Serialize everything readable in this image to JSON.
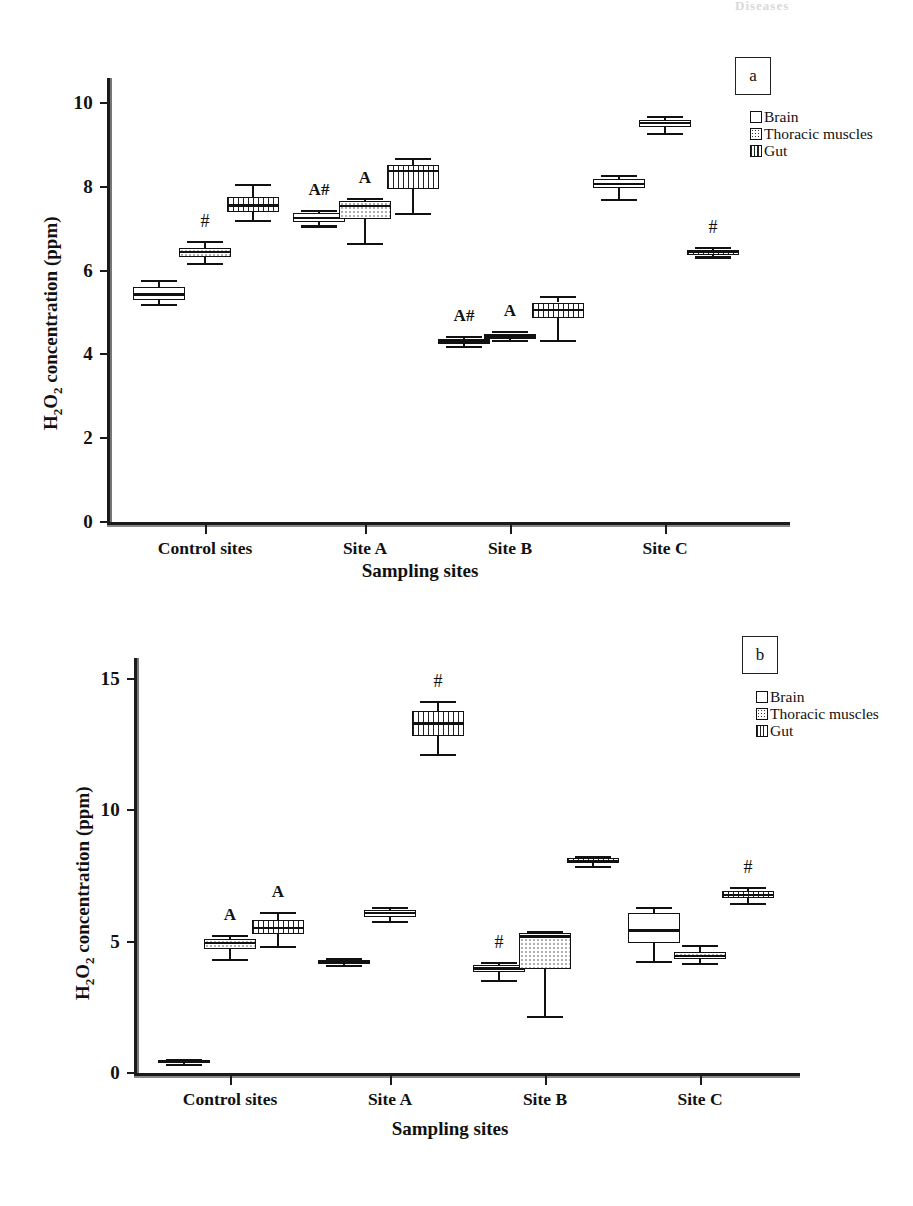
{
  "figure": {
    "top_fragment": "Diseases"
  },
  "panels": [
    {
      "letter": "a",
      "legend": [
        {
          "key": "brain",
          "label": "Brain"
        },
        {
          "key": "thoracic",
          "label": "Thoracic muscles"
        },
        {
          "key": "gut",
          "label": "Gut"
        }
      ],
      "chart_data": {
        "type": "box",
        "title": "",
        "xlabel": "Sampling sites",
        "ylabel": "H2O2 concentration (ppm)",
        "ylabel_html": "H<sub>2</sub>O<sub>2</sub> concentration (ppm)",
        "categories": [
          "Control sites",
          "Site A",
          "Site B",
          "Site C"
        ],
        "yticks": [
          0,
          2,
          4,
          6,
          8,
          10
        ],
        "ylim": [
          0,
          10.6
        ],
        "grid": false,
        "legend_position": "top-right",
        "series": [
          {
            "name": "Brain",
            "boxes": [
              {
                "category": "Control sites",
                "min": 5.2,
                "q1": 5.3,
                "median": 5.43,
                "q3": 5.6,
                "max": 5.78,
                "annotation": ""
              },
              {
                "category": "Site A",
                "min": 7.08,
                "q1": 7.17,
                "median": 7.26,
                "q3": 7.38,
                "max": 7.45,
                "annotation": "A#"
              },
              {
                "category": "Site B",
                "min": 4.2,
                "q1": 4.25,
                "median": 4.31,
                "q3": 4.38,
                "max": 4.44,
                "annotation": "A#"
              },
              {
                "category": "Site C",
                "min": 7.72,
                "q1": 7.97,
                "median": 8.07,
                "q3": 8.2,
                "max": 8.28,
                "annotation": ""
              }
            ]
          },
          {
            "name": "Thoracic muscles",
            "boxes": [
              {
                "category": "Control sites",
                "min": 6.18,
                "q1": 6.33,
                "median": 6.44,
                "q3": 6.55,
                "max": 6.72,
                "annotation": "#"
              },
              {
                "category": "Site A",
                "min": 6.67,
                "q1": 7.24,
                "median": 7.55,
                "q3": 7.66,
                "max": 7.74,
                "annotation": "A"
              },
              {
                "category": "Site B",
                "min": 4.34,
                "q1": 4.38,
                "median": 4.43,
                "q3": 4.5,
                "max": 4.56,
                "annotation": "A"
              },
              {
                "category": "Site C",
                "min": 9.28,
                "q1": 9.43,
                "median": 9.52,
                "q3": 9.6,
                "max": 9.7,
                "annotation": ""
              }
            ]
          },
          {
            "name": "Gut",
            "boxes": [
              {
                "category": "Control sites",
                "min": 7.22,
                "q1": 7.4,
                "median": 7.56,
                "q3": 7.76,
                "max": 8.08,
                "annotation": ""
              },
              {
                "category": "Site A",
                "min": 7.38,
                "q1": 7.96,
                "median": 8.38,
                "q3": 8.52,
                "max": 8.7,
                "annotation": ""
              },
              {
                "category": "Site B",
                "min": 4.34,
                "q1": 4.86,
                "median": 5.06,
                "q3": 5.24,
                "max": 5.4,
                "annotation": ""
              },
              {
                "category": "Site C",
                "min": 6.34,
                "q1": 6.38,
                "median": 6.44,
                "q3": 6.5,
                "max": 6.56,
                "annotation": "#"
              }
            ]
          }
        ]
      }
    },
    {
      "letter": "b",
      "legend": [
        {
          "key": "brain",
          "label": "Brain"
        },
        {
          "key": "thoracic",
          "label": "Thoracic muscles"
        },
        {
          "key": "gut",
          "label": "Gut"
        }
      ],
      "chart_data": {
        "type": "box",
        "title": "",
        "xlabel": "Sampling sites",
        "ylabel": "H2O2 concentration (ppm)",
        "ylabel_html": "H<sub>2</sub>O<sub>2</sub> concentration (ppm)",
        "categories": [
          "Control sites",
          "Site A",
          "Site B",
          "Site C"
        ],
        "yticks": [
          0,
          5,
          10,
          15
        ],
        "ylim": [
          0,
          15.8
        ],
        "grid": false,
        "legend_position": "top-right",
        "series": [
          {
            "name": "Brain",
            "boxes": [
              {
                "category": "Control sites",
                "min": 0.36,
                "q1": 0.4,
                "median": 0.44,
                "q3": 0.48,
                "max": 0.52,
                "annotation": ""
              },
              {
                "category": "Site A",
                "min": 4.1,
                "q1": 4.15,
                "median": 4.22,
                "q3": 4.3,
                "max": 4.36,
                "annotation": ""
              },
              {
                "category": "Site B",
                "min": 3.55,
                "q1": 3.86,
                "median": 3.98,
                "q3": 4.1,
                "max": 4.22,
                "annotation": "#"
              },
              {
                "category": "Site C",
                "min": 4.28,
                "q1": 4.95,
                "median": 5.42,
                "q3": 6.1,
                "max": 6.32,
                "annotation": ""
              }
            ]
          },
          {
            "name": "Thoracic muscles",
            "boxes": [
              {
                "category": "Control sites",
                "min": 4.33,
                "q1": 4.72,
                "median": 4.95,
                "q3": 5.12,
                "max": 5.25,
                "annotation": "A"
              },
              {
                "category": "Site A",
                "min": 5.78,
                "q1": 5.95,
                "median": 6.08,
                "q3": 6.22,
                "max": 6.32,
                "annotation": ""
              },
              {
                "category": "Site B",
                "min": 2.18,
                "q1": 3.95,
                "median": 5.2,
                "q3": 5.32,
                "max": 5.42,
                "annotation": ""
              },
              {
                "category": "Site C",
                "min": 4.18,
                "q1": 4.33,
                "median": 4.45,
                "q3": 4.62,
                "max": 4.88,
                "annotation": ""
              }
            ]
          },
          {
            "name": "Gut",
            "boxes": [
              {
                "category": "Control sites",
                "min": 4.85,
                "q1": 5.3,
                "median": 5.52,
                "q3": 5.82,
                "max": 6.12,
                "annotation": "A"
              },
              {
                "category": "Site A",
                "min": 12.15,
                "q1": 12.82,
                "median": 13.3,
                "q3": 13.78,
                "max": 14.18,
                "annotation": "#"
              },
              {
                "category": "Site B",
                "min": 7.88,
                "q1": 7.98,
                "median": 8.08,
                "q3": 8.18,
                "max": 8.28,
                "annotation": ""
              },
              {
                "category": "Site C",
                "min": 6.48,
                "q1": 6.66,
                "median": 6.78,
                "q3": 6.92,
                "max": 7.08,
                "annotation": "#"
              }
            ]
          }
        ]
      }
    }
  ],
  "geometry": {
    "panel_a": {
      "x0": 107,
      "x1": 790,
      "y_top": 78,
      "y_zero": 522,
      "yval_top": 10.6,
      "group_centers": [
        205,
        365,
        510,
        665
      ],
      "series_offsets": [
        -46,
        0,
        48
      ],
      "box_width": 52,
      "legend_x": 750,
      "legend_y": 108,
      "letter_x": 735,
      "letter_y": 57,
      "ylabel_x": 40,
      "ylabel_y": 430,
      "xlabel_x": 420,
      "xlabel_y": 560
    },
    "panel_b": {
      "x0": 134,
      "x1": 800,
      "y_top": 658,
      "y_zero": 1073,
      "yval_top": 15.8,
      "group_centers": [
        230,
        390,
        545,
        700
      ],
      "series_offsets": [
        -46,
        0,
        48
      ],
      "box_width": 52,
      "legend_x": 756,
      "legend_y": 688,
      "letter_x": 742,
      "letter_y": 636,
      "ylabel_x": 72,
      "ylabel_y": 1000,
      "xlabel_x": 450,
      "xlabel_y": 1118
    }
  }
}
